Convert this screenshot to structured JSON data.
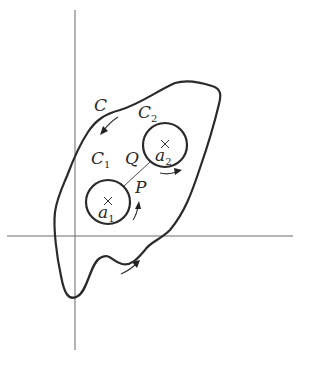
{
  "figure": {
    "labels": {
      "C": {
        "main": "C",
        "sub": ""
      },
      "C2": {
        "main": "C",
        "sub": "2"
      },
      "C1": {
        "main": "C",
        "sub": "1"
      },
      "Q": {
        "main": "Q",
        "sub": ""
      },
      "P": {
        "main": "P",
        "sub": ""
      },
      "a1": {
        "main": "a",
        "sub": "1"
      },
      "a2": {
        "main": "a",
        "sub": "2"
      }
    },
    "points": {
      "a1": {
        "marker": "×"
      },
      "a2": {
        "marker": "×"
      }
    },
    "colors": {
      "stroke": "#2a2a2a",
      "axis": "#6a6a6a",
      "background": "#ffffff"
    }
  }
}
